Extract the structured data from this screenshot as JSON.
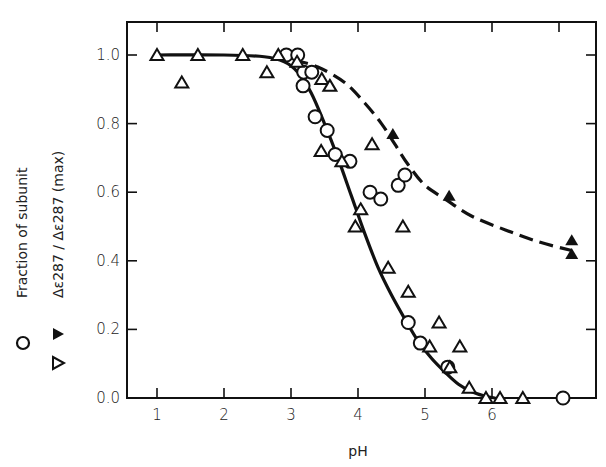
{
  "chart_data": {
    "type": "scatter",
    "title": "",
    "xlabel": "pH",
    "ylabel_lines": [
      "Fraction of subunit",
      "Δε287/Δε287(max)"
    ],
    "ylabel_primary": "Fraction of subunit",
    "ylabel_secondary": "Δε287 / Δε287 (max)",
    "xlim": [
      0.55,
      7.5
    ],
    "ylim": [
      0.0,
      1.1
    ],
    "x_ticks": [
      1,
      2,
      3,
      4,
      5,
      6
    ],
    "x_tick_labels": [
      "1",
      "2",
      "3",
      "4",
      "5",
      "6"
    ],
    "top_ticks": [
      1,
      2,
      3,
      4,
      5,
      6,
      7
    ],
    "y_ticks": [
      0.0,
      0.2,
      0.4,
      0.6,
      0.8,
      1.0
    ],
    "y_tick_labels": [
      "0.0",
      "0.2",
      "0.4",
      "0.6",
      "0.8",
      "1.0"
    ],
    "grid": false,
    "legend": {
      "position": "left, rotated alongside y-axis label",
      "entries": [
        {
          "marker": "open-circle",
          "label": "Fraction of subunit"
        },
        {
          "marker": "filled-triangle",
          "label": "Δε287/Δε287(max)"
        },
        {
          "marker": "open-triangle",
          "label": "Δε287/Δε287(max)"
        }
      ]
    },
    "series": [
      {
        "name": "Fraction of subunit",
        "marker": "open-circle",
        "points": [
          [
            2.93,
            1.0
          ],
          [
            3.1,
            1.0
          ],
          [
            3.19,
            0.95
          ],
          [
            3.31,
            0.95
          ],
          [
            3.18,
            0.91
          ],
          [
            3.36,
            0.82
          ],
          [
            3.54,
            0.78
          ],
          [
            3.66,
            0.71
          ],
          [
            3.88,
            0.69
          ],
          [
            4.18,
            0.6
          ],
          [
            4.34,
            0.58
          ],
          [
            4.6,
            0.62
          ],
          [
            4.7,
            0.65
          ],
          [
            4.75,
            0.22
          ],
          [
            4.93,
            0.16
          ],
          [
            5.34,
            0.09
          ],
          [
            7.06,
            0.0
          ]
        ]
      },
      {
        "name": "Δε287/Δε287(max) (open triangles)",
        "marker": "open-triangle",
        "points": [
          [
            1.0,
            1.0
          ],
          [
            1.37,
            0.92
          ],
          [
            1.61,
            1.0
          ],
          [
            2.28,
            1.0
          ],
          [
            2.64,
            0.95
          ],
          [
            2.81,
            1.0
          ],
          [
            3.09,
            0.98
          ],
          [
            3.46,
            0.93
          ],
          [
            3.58,
            0.91
          ],
          [
            3.45,
            0.72
          ],
          [
            3.76,
            0.69
          ],
          [
            4.21,
            0.74
          ],
          [
            3.96,
            0.5
          ],
          [
            4.04,
            0.55
          ],
          [
            4.67,
            0.5
          ],
          [
            4.45,
            0.38
          ],
          [
            4.75,
            0.31
          ],
          [
            5.21,
            0.22
          ],
          [
            5.07,
            0.15
          ],
          [
            5.52,
            0.15
          ],
          [
            5.37,
            0.09
          ],
          [
            5.66,
            0.03
          ],
          [
            5.91,
            0.0
          ],
          [
            6.12,
            0.0
          ],
          [
            6.46,
            0.0
          ]
        ]
      },
      {
        "name": "Δε287/Δε287(max) (filled triangles)",
        "marker": "filled-triangle",
        "points": [
          [
            4.52,
            0.77
          ],
          [
            5.36,
            0.59
          ],
          [
            7.19,
            0.46
          ],
          [
            7.19,
            0.42
          ]
        ]
      },
      {
        "name": "Fitted curve (solid)",
        "style": "solid-line",
        "points": [
          [
            1.0,
            1.0
          ],
          [
            2.0,
            1.0
          ],
          [
            2.6,
            0.995
          ],
          [
            2.9,
            0.98
          ],
          [
            3.1,
            0.95
          ],
          [
            3.3,
            0.89
          ],
          [
            3.5,
            0.8
          ],
          [
            3.7,
            0.7
          ],
          [
            3.9,
            0.59
          ],
          [
            4.1,
            0.48
          ],
          [
            4.3,
            0.38
          ],
          [
            4.5,
            0.3
          ],
          [
            4.7,
            0.23
          ],
          [
            4.9,
            0.165
          ],
          [
            5.1,
            0.115
          ],
          [
            5.3,
            0.075
          ],
          [
            5.5,
            0.04
          ],
          [
            5.7,
            0.018
          ],
          [
            5.9,
            0.005
          ],
          [
            6.05,
            0.0
          ]
        ]
      },
      {
        "name": "Fitted curve (dashed)",
        "style": "dashed-line",
        "points": [
          [
            3.05,
            0.985
          ],
          [
            3.4,
            0.965
          ],
          [
            3.8,
            0.92
          ],
          [
            4.1,
            0.86
          ],
          [
            4.35,
            0.8
          ],
          [
            4.55,
            0.74
          ],
          [
            4.75,
            0.68
          ],
          [
            5.0,
            0.62
          ],
          [
            5.3,
            0.58
          ],
          [
            5.7,
            0.53
          ],
          [
            6.2,
            0.49
          ],
          [
            6.7,
            0.455
          ],
          [
            7.19,
            0.43
          ]
        ]
      }
    ]
  }
}
